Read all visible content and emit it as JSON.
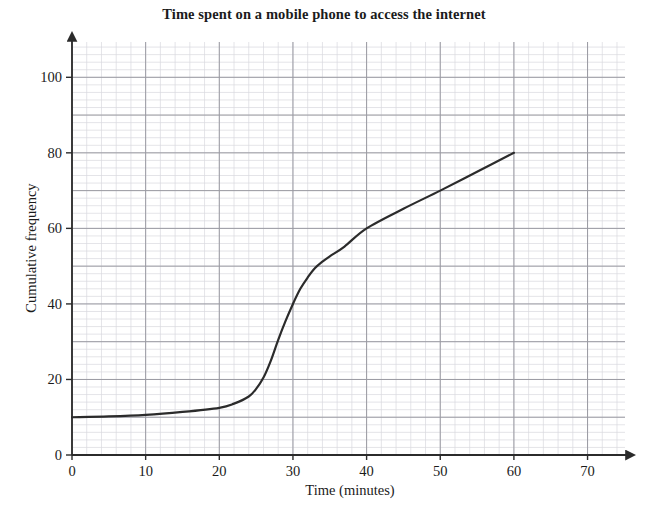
{
  "chart_data": {
    "type": "line",
    "title": "Time spent on a mobile phone to access the internet",
    "xlabel": "Time (minutes)",
    "ylabel": "Cumulative frequency",
    "xlim": [
      0,
      75
    ],
    "ylim": [
      0,
      108
    ],
    "xticks": [
      0,
      10,
      20,
      30,
      40,
      50,
      60,
      70
    ],
    "yticks": [
      0,
      20,
      40,
      60,
      80,
      100
    ],
    "grid": "graph-paper minor 2 units, major 10 units",
    "legend": "none",
    "series": [
      {
        "name": "Cumulative frequency",
        "x": [
          0,
          5,
          10,
          15,
          20,
          22,
          24,
          25,
          26,
          27,
          28,
          29,
          30,
          31,
          32,
          33,
          34,
          35,
          37,
          40,
          45,
          50,
          55,
          60
        ],
        "values": [
          10,
          10.2,
          10.6,
          11.4,
          12.5,
          13.6,
          15.5,
          17.5,
          20.5,
          25,
          30.5,
          35.5,
          40,
          44,
          47,
          49.5,
          51.2,
          52.6,
          55.2,
          60,
          65.2,
          70,
          75,
          80
        ]
      }
    ],
    "annotations": [],
    "line_color": "#2b2b2b",
    "grid_minor_color": "#d9d9de",
    "grid_major_color": "#9a9aa2",
    "axis_color": "#2b2b2b"
  },
  "axis": {
    "x_tick_labels": [
      "0",
      "10",
      "20",
      "30",
      "40",
      "50",
      "60",
      "70"
    ],
    "y_tick_labels": [
      "0",
      "20",
      "40",
      "60",
      "80",
      "100"
    ],
    "x_title": "Time (minutes)",
    "y_title": "Cumulative frequency",
    "origin_label": "0"
  },
  "header": {
    "title": "Time spent on a mobile phone to access the internet"
  }
}
